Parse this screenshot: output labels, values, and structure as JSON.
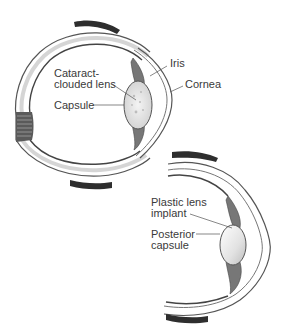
{
  "diagram": {
    "type": "anatomical-illustration",
    "panels": [
      {
        "id": "before",
        "labels": {
          "iris": "Iris",
          "cornea": "Cornea",
          "cataract_line1": "Cataract-",
          "cataract_line2": "clouded lens",
          "capsule": "Capsule"
        }
      },
      {
        "id": "after",
        "labels": {
          "implant_line1": "Plastic lens",
          "implant_line2": "implant",
          "posterior_line1": "Posterior",
          "posterior_line2": "capsule"
        }
      }
    ],
    "colors": {
      "outline": "#4a4a4a",
      "sclera_fill": "#ececec",
      "muscle": "#2e2e2e",
      "lens_fill": "#dcdcdc",
      "iris_fill": "#7a7a7a",
      "background": "#ffffff"
    }
  }
}
